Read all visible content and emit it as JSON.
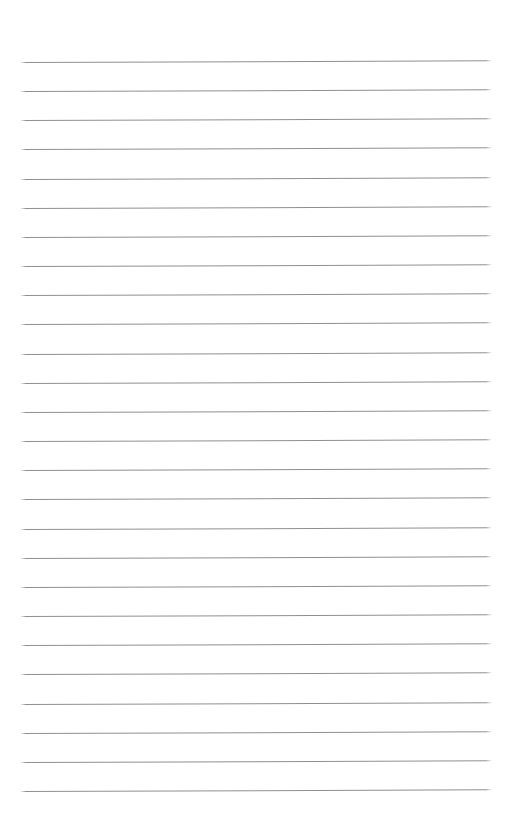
{
  "page": {
    "type": "blank-ruled-notebook-page",
    "paper_color": "#ffffff",
    "text_content": "",
    "ruling": {
      "line_count": 26,
      "line_color": "#8f8f8f",
      "line_end_fade_px": 6,
      "first_line_top_px": 62,
      "line_spacing_px": 29.16,
      "line_left_px": 20,
      "line_width_px": 472,
      "line_thickness_px": 1,
      "tilt_deg": -0.2
    }
  }
}
